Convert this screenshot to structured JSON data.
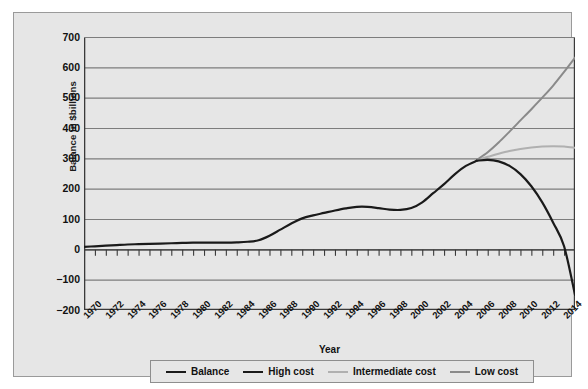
{
  "chart_data": {
    "type": "line",
    "title": "",
    "xlabel": "Year",
    "ylabel": "Balance in $billions",
    "xlim": [
      1970,
      2015
    ],
    "ylim": [
      -200,
      700
    ],
    "ytick_step": 100,
    "xtick_label_step": 2,
    "xtick_minor_step": 1,
    "grid": "horizontal",
    "legend_position": "bottom",
    "yticks": [
      700,
      600,
      500,
      400,
      300,
      200,
      100,
      0,
      -100,
      -200
    ],
    "ytick_labels": [
      "700",
      "600",
      "500",
      "400",
      "300",
      "200",
      "100",
      "0",
      "-100",
      "-200"
    ],
    "xticks": [
      1970,
      1972,
      1974,
      1976,
      1978,
      1980,
      1982,
      1984,
      1986,
      1988,
      1990,
      1992,
      1994,
      1996,
      1998,
      2000,
      2002,
      2004,
      2006,
      2008,
      2010,
      2012,
      2014
    ],
    "xtick_labels": [
      "1970",
      "1972",
      "1974",
      "1976",
      "1978",
      "1980",
      "1982",
      "1984",
      "1986",
      "1988",
      "1990",
      "1992",
      "1994",
      "1996",
      "1998",
      "2000",
      "2002",
      "2004",
      "2006",
      "2008",
      "2010",
      "2012",
      "2014"
    ],
    "colors": {
      "balance": "#1a1a1a",
      "high_cost": "#1a1a1a",
      "intermediate_cost": "#b0b0b0",
      "low_cost": "#8a8a8a",
      "grid": "#7d7d7d",
      "axis": "#3a3a3a",
      "plot_background": "#e6e6e6",
      "panel_background": "#e6e6e6"
    },
    "series": [
      {
        "name": "Balance",
        "color": "#1a1a1a",
        "width": 2.2,
        "x": [
          1970,
          1971,
          1972,
          1973,
          1974,
          1975,
          1976,
          1977,
          1978,
          1979,
          1980,
          1981,
          1982,
          1983,
          1984,
          1985,
          1986,
          1987,
          1988,
          1989,
          1990,
          1991,
          1992,
          1993,
          1994,
          1995,
          1996,
          1997,
          1998,
          1999,
          2000,
          2001,
          2002,
          2003,
          2004,
          2005,
          2006
        ],
        "values": [
          8,
          10,
          12,
          14,
          16,
          17,
          18,
          19,
          20,
          21,
          22,
          22,
          22,
          22,
          23,
          25,
          30,
          45,
          65,
          85,
          102,
          112,
          120,
          128,
          135,
          140,
          140,
          136,
          131,
          130,
          136,
          155,
          185,
          215,
          248,
          275,
          292
        ]
      },
      {
        "name": "High cost",
        "color": "#1a1a1a",
        "width": 2.2,
        "x": [
          2006,
          2007,
          2008,
          2009,
          2010,
          2011,
          2012,
          2013,
          2014,
          2015
        ],
        "values": [
          292,
          295,
          290,
          275,
          248,
          208,
          155,
          88,
          10,
          -150
        ]
      },
      {
        "name": "Intermediate cost",
        "color": "#b0b0b0",
        "width": 2.0,
        "x": [
          2006,
          2007,
          2008,
          2009,
          2010,
          2011,
          2012,
          2013,
          2014,
          2015
        ],
        "values": [
          295,
          305,
          315,
          324,
          331,
          336,
          339,
          340,
          339,
          335
        ]
      },
      {
        "name": "Low cost",
        "color": "#8a8a8a",
        "width": 2.0,
        "x": [
          2006,
          2007,
          2008,
          2009,
          2010,
          2011,
          2012,
          2013,
          2014,
          2015
        ],
        "values": [
          295,
          320,
          352,
          388,
          425,
          462,
          500,
          540,
          585,
          632
        ]
      }
    ],
    "legend": [
      {
        "label": "Balance",
        "color": "#1a1a1a",
        "width": 2.4
      },
      {
        "label": "High cost",
        "color": "#1a1a1a",
        "width": 2.4
      },
      {
        "label": "Intermediate cost",
        "color": "#b0b0b0",
        "width": 2.0
      },
      {
        "label": "Low cost",
        "color": "#8a8a8a",
        "width": 2.0
      }
    ]
  }
}
